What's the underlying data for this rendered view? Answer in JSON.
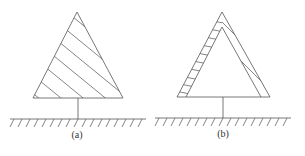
{
  "figures": [
    {
      "id": "a",
      "label": "(a)",
      "description": "Fully hatched triangle on a stem above hatched ground"
    },
    {
      "id": "b",
      "label": "(b)",
      "description": "Hollow triangle with hatched edge bands on a stem above hatched ground"
    }
  ],
  "colors": {
    "stroke": "#555555",
    "background": "#ffffff"
  }
}
